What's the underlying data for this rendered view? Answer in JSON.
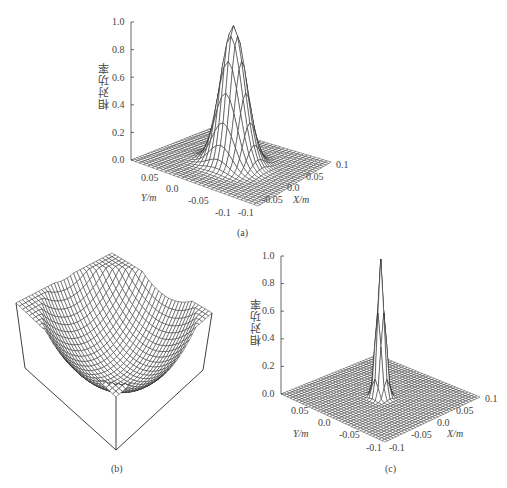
{
  "chart_data": [
    {
      "id": "a",
      "type": "surface",
      "caption": "(a)",
      "zlabel": "相对功率",
      "xlabel": "X/m",
      "ylabel": "Y/m",
      "z_ticks": [
        "1.0",
        "0.8",
        "0.6",
        "0.4",
        "0.2",
        "0.0"
      ],
      "x_ticks": [
        "-0.1",
        "-0.05",
        "0.0",
        "0.05",
        "0.1"
      ],
      "y_ticks": [
        "0.05",
        "0.0",
        "-0.05",
        "-0.1"
      ],
      "zlim": [
        0,
        1.0
      ],
      "xlim": [
        -0.1,
        0.1
      ],
      "ylim": [
        -0.1,
        0.1
      ],
      "description": "Gaussian-like beam peak, max relative power 1.0 near (X,Y)=(0,0), width ~0.02 m",
      "peak": {
        "x": 0.0,
        "y": 0.0,
        "z": 1.0,
        "sigma": 0.018
      }
    },
    {
      "id": "b",
      "type": "surface",
      "caption": "(b)",
      "description": "Bowl-shaped (concave) mesh surface shown inside open box frame, no axis labels"
    },
    {
      "id": "c",
      "type": "surface",
      "caption": "(c)",
      "zlabel": "相对功率",
      "xlabel": "X/m",
      "ylabel": "Y/m",
      "z_ticks": [
        "1.0",
        "0.8",
        "0.6",
        "0.4",
        "0.2",
        "0.0"
      ],
      "x_ticks": [
        "-0.1",
        "-0.05",
        "0.0",
        "0.05",
        "0.1"
      ],
      "y_ticks": [
        "0.05",
        "0.0",
        "-0.05",
        "-0.1"
      ],
      "zlim": [
        0,
        1.0
      ],
      "xlim": [
        -0.1,
        0.1
      ],
      "ylim": [
        -0.1,
        0.1
      ],
      "description": "Sharply focused narrow spike, max relative power 1.0 near (X,Y)=(0,0)",
      "peak": {
        "x": 0.0,
        "y": 0.0,
        "z": 1.0,
        "sigma": 0.006
      }
    }
  ],
  "panels": {
    "a": {
      "caption": "(a)",
      "zlabel": "相对功率",
      "z_ticks": [
        "1.0",
        "0.8",
        "0.6",
        "0.4",
        "0.2",
        "0.0"
      ],
      "y_ticks": [
        "0.05",
        "0.0",
        "-0.05",
        "-0.1"
      ],
      "x_ticks": [
        "-0.1",
        "-0.05",
        "0.0",
        "0.05",
        "0.1"
      ],
      "xlabel": "X/m",
      "ylabel": "Y/m"
    },
    "b": {
      "caption": "(b)"
    },
    "c": {
      "caption": "(c)",
      "zlabel": "相对功率",
      "z_ticks": [
        "1.0",
        "0.8",
        "0.6",
        "0.4",
        "0.2",
        "0.0"
      ],
      "y_ticks": [
        "0.05",
        "0.0",
        "-0.05",
        "-0.1"
      ],
      "x_ticks": [
        "-0.1",
        "-0.05",
        "0.0",
        "0.05",
        "0.1"
      ],
      "xlabel": "X/m",
      "ylabel": "Y/m"
    }
  },
  "colors": {
    "ink": "#2a2a2a",
    "label": "#444444",
    "background": "#ffffff"
  }
}
